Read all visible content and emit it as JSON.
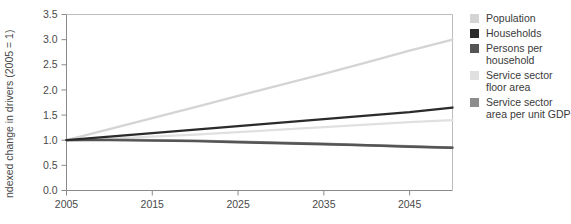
{
  "chart_data": {
    "type": "line",
    "title": "",
    "xlabel": "",
    "ylabel": "Indexed change in drivers (2005 = 1)",
    "xlim": [
      2005,
      2050
    ],
    "ylim": [
      0.0,
      3.5
    ],
    "grid": false,
    "legend_position": "right",
    "x_ticks": [
      "2005",
      "2015",
      "2025",
      "2035",
      "2045"
    ],
    "x_tick_values": [
      2005,
      2015,
      2025,
      2035,
      2045
    ],
    "y_ticks": [
      "0.0",
      "0.5",
      "1.0",
      "1.5",
      "2.0",
      "2.5",
      "3.0",
      "3.5"
    ],
    "y_tick_values": [
      0.0,
      0.5,
      1.0,
      1.5,
      2.0,
      2.5,
      3.0,
      3.5
    ],
    "x": [
      2005,
      2010,
      2015,
      2020,
      2025,
      2030,
      2035,
      2040,
      2045,
      2050
    ],
    "series": [
      {
        "name": "Population",
        "color": "#d4d4d4",
        "values": [
          1.0,
          1.22,
          1.44,
          1.66,
          1.88,
          2.1,
          2.32,
          2.55,
          2.78,
          3.0
        ]
      },
      {
        "name": "Households",
        "color": "#2b2b2b",
        "values": [
          1.0,
          1.07,
          1.14,
          1.21,
          1.28,
          1.35,
          1.42,
          1.49,
          1.56,
          1.65
        ]
      },
      {
        "name": "Persons per household",
        "color": "#555555",
        "values": [
          1.0,
          1.0,
          0.99,
          0.98,
          0.96,
          0.94,
          0.92,
          0.9,
          0.87,
          0.85
        ]
      },
      {
        "name": "Service sector floor area",
        "color": "#e0e0e0",
        "values": [
          1.0,
          1.03,
          1.07,
          1.11,
          1.16,
          1.21,
          1.26,
          1.31,
          1.36,
          1.4
        ]
      },
      {
        "name": "Service sector area per unit GDP",
        "color": "#8c8c8c",
        "values": [
          1.0,
          1.01,
          1.0,
          0.99,
          0.97,
          0.95,
          0.93,
          0.9,
          0.88,
          0.85
        ]
      }
    ]
  },
  "axis": {
    "y_title": "ndexed change in drivers (2005 = 1)"
  },
  "legend": {
    "items": [
      {
        "label": "Population",
        "color": "#d4d4d4"
      },
      {
        "label": "Households",
        "color": "#2b2b2b"
      },
      {
        "label": "Persons per household",
        "color": "#555555"
      },
      {
        "label": "Service sector floor area",
        "color": "#e0e0e0"
      },
      {
        "label": "Service sector area per unit GDP",
        "color": "#8c8c8c"
      }
    ]
  }
}
